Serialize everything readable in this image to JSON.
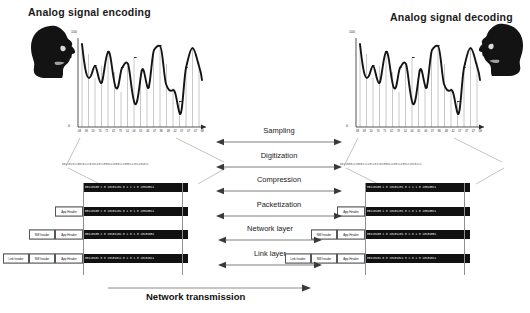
{
  "diagram": {
    "title_left": "Analog signal encoding",
    "title_right": "Analog signal decoding",
    "bottom_label": "Network transmission",
    "axis": {
      "max_label": "100",
      "zero_label": "0",
      "tick_labels": [
        "08",
        "09",
        "10",
        "70",
        "71",
        "42",
        "73",
        "14",
        "04",
        "05",
        "46",
        "07",
        "86",
        "48",
        "42",
        "07",
        "07",
        "07",
        "08"
      ]
    },
    "center_steps": [
      {
        "label": "Sampling",
        "arrow": "double"
      },
      {
        "label": "Digitization",
        "arrow": "double"
      },
      {
        "label": "Compression",
        "arrow": "double"
      },
      {
        "label": "Packetization",
        "arrow": "double"
      },
      {
        "label": "Network layer",
        "arrow": "double"
      },
      {
        "label": "Link layer",
        "arrow": "double"
      }
    ],
    "headers": {
      "app": "App Header",
      "network": "NW header",
      "link": "Link header"
    },
    "bit_stream_left": "00110101100101110101101100011100011100011101101011",
    "bit_stream_right": "00110001110001111011011010001110011100111010111",
    "packets": [
      {
        "headers": [],
        "payload": "00110100 1 0 10101101 0 1 1 1 0 10010011"
      },
      {
        "headers": [
          "app"
        ],
        "payload": "00110100 1 0 10101101 0 1 0 1 0 10010011"
      },
      {
        "headers": [
          "network",
          "app"
        ],
        "payload": "00110100 1 0 10101101 0 1 0 1 0 10101001"
      },
      {
        "headers": [
          "link",
          "network",
          "app"
        ],
        "payload": "00110101 0 0 10101011 0 1 0 1 0 10101011"
      }
    ],
    "colors": {
      "payload_bg": "#111111",
      "payload_text": "#ffffff",
      "line": "#8e8e8e",
      "text": "#111111"
    },
    "waveform": {
      "peaks": 6,
      "sample_count": 19,
      "description": "analog sine-like waveform with sampling drop lines"
    }
  }
}
